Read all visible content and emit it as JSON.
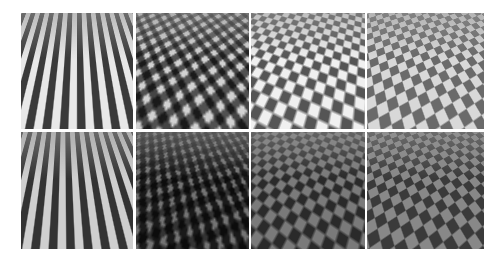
{
  "figure": {
    "layout": {
      "rows": 2,
      "columns": 4
    },
    "tiles": [
      {
        "row": 1,
        "col": 1,
        "description": "vertical stripe texture on receding plane, light"
      },
      {
        "row": 1,
        "col": 2,
        "description": "diagonal weave texture on receding plane, light"
      },
      {
        "row": 1,
        "col": 3,
        "description": "checkerboard texture on receding plane, light"
      },
      {
        "row": 1,
        "col": 4,
        "description": "checkerboard texture on receding plane, medium gray"
      },
      {
        "row": 2,
        "col": 1,
        "description": "vertical stripe texture on receding plane, dark"
      },
      {
        "row": 2,
        "col": 2,
        "description": "diagonal weave texture on receding plane, dark"
      },
      {
        "row": 2,
        "col": 3,
        "description": "checkerboard texture on receding plane, dark"
      },
      {
        "row": 2,
        "col": 4,
        "description": "checkerboard texture on receding plane, dark gray"
      }
    ],
    "colors": {
      "background": "#ffffff",
      "separator": "#ffffff"
    }
  }
}
